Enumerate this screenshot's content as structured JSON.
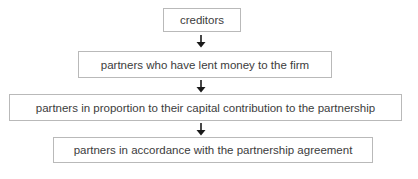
{
  "diagram": {
    "type": "flowchart",
    "direction": "top-to-bottom",
    "nodes": [
      {
        "id": "n1",
        "label": "creditors"
      },
      {
        "id": "n2",
        "label": "partners who have lent money to the firm"
      },
      {
        "id": "n3",
        "label": "partners in proportion to their capital contribution to the partnership"
      },
      {
        "id": "n4",
        "label": "partners in accordance with the partnership agreement"
      }
    ],
    "edges": [
      {
        "from": "n1",
        "to": "n2",
        "icon": "arrow-down-icon"
      },
      {
        "from": "n2",
        "to": "n3",
        "icon": "arrow-down-icon"
      },
      {
        "from": "n3",
        "to": "n4",
        "icon": "arrow-down-icon"
      }
    ],
    "colors": {
      "border": "#b9b9b9",
      "text": "#3c3c3c",
      "arrow": "#1a1a1a"
    }
  }
}
